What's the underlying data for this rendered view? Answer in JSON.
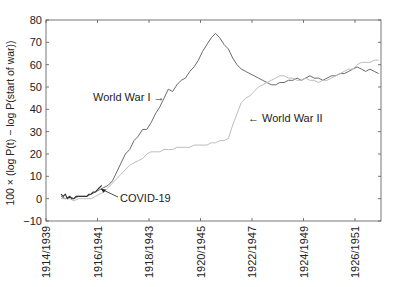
{
  "chart_data": {
    "type": "line",
    "title": "",
    "xlabel": "",
    "ylabel": "100 × (log P(t) − log P(start of war))",
    "ylim": [
      -10,
      80
    ],
    "yticks": [
      -10,
      0,
      10,
      20,
      30,
      40,
      50,
      60,
      70,
      80
    ],
    "xticks": [
      "1914/1939",
      "1916/1941",
      "1918/1943",
      "1920/1945",
      "1922/1947",
      "1924/1949",
      "1926/1951"
    ],
    "x_unit": "months since start of tick 1914/1939",
    "grid": false,
    "legend": "none (inline annotations)",
    "series": [
      {
        "name": "World War I",
        "color": "#6b6b6b",
        "x": [
          7,
          9,
          11,
          13,
          15,
          17,
          19,
          21,
          23,
          25,
          27,
          29,
          31,
          33,
          35,
          37,
          39,
          41,
          43,
          45,
          47,
          49,
          51,
          53,
          55,
          57,
          59,
          61,
          63,
          65,
          67,
          69,
          71,
          73,
          75,
          77,
          79,
          81,
          83,
          85,
          87,
          89,
          91,
          93,
          95,
          97,
          99,
          101,
          103,
          105,
          107,
          109,
          111,
          113,
          115,
          117,
          119,
          121,
          123,
          125,
          127,
          129,
          131,
          133,
          135,
          137,
          139,
          141,
          143,
          145,
          147,
          149,
          151,
          153,
          155
        ],
        "values": [
          1,
          0,
          1,
          0,
          1,
          1,
          1,
          2,
          3,
          4,
          5,
          6,
          8,
          12,
          16,
          20,
          22,
          26,
          28,
          31,
          31,
          34,
          38,
          41,
          45,
          49,
          48,
          51,
          53,
          54,
          57,
          59,
          62,
          66,
          69,
          72,
          74,
          72,
          69,
          67,
          63,
          60,
          58,
          57,
          56,
          55,
          54,
          53,
          52,
          51,
          51,
          52,
          52,
          53,
          53,
          54,
          53,
          54,
          55,
          54,
          54,
          53,
          54,
          55,
          55,
          56,
          56,
          57,
          58,
          59,
          58,
          57,
          58,
          57,
          56
        ]
      },
      {
        "name": "World War II",
        "color": "#bdbdbd",
        "x": [
          7,
          9,
          11,
          13,
          15,
          17,
          19,
          21,
          23,
          25,
          27,
          29,
          31,
          33,
          35,
          37,
          39,
          41,
          43,
          45,
          47,
          49,
          51,
          53,
          55,
          57,
          59,
          61,
          63,
          65,
          67,
          69,
          71,
          73,
          75,
          77,
          79,
          81,
          83,
          85,
          87,
          89,
          91,
          93,
          95,
          97,
          99,
          101,
          103,
          105,
          107,
          109,
          111,
          113,
          115,
          117,
          119,
          121,
          123,
          125,
          127,
          129,
          131,
          133,
          135,
          137,
          139,
          141,
          143,
          145,
          147,
          149,
          151,
          153,
          155
        ],
        "values": [
          0,
          0,
          0,
          -1,
          0,
          0,
          0,
          0,
          1,
          2,
          3,
          5,
          7,
          9,
          11,
          13,
          15,
          16,
          17,
          18,
          20,
          21,
          21,
          21,
          22,
          22,
          22,
          23,
          23,
          23,
          23,
          24,
          24,
          24,
          24,
          25,
          25,
          26,
          26,
          27,
          33,
          38,
          43,
          45,
          46,
          48,
          50,
          51,
          52,
          53,
          54,
          55,
          55,
          54,
          54,
          53,
          53,
          54,
          53,
          53,
          52,
          53,
          53,
          54,
          55,
          56,
          57,
          58,
          58,
          60,
          61,
          61,
          61,
          62,
          62
        ]
      },
      {
        "name": "COVID-19",
        "color": "#333333",
        "x": [
          7,
          8,
          9,
          10,
          11,
          12,
          13,
          14,
          15,
          16,
          17,
          18,
          19,
          20,
          21,
          22,
          23,
          24,
          25,
          26
        ],
        "values": [
          2,
          1,
          2,
          0,
          1,
          0,
          0,
          1,
          1,
          1,
          1,
          1,
          1,
          2,
          2,
          3,
          3,
          4,
          5,
          6
        ]
      }
    ],
    "annotations": [
      {
        "text": "World War I →",
        "target_series": "World War I"
      },
      {
        "text": "← World War II",
        "target_series": "World War II"
      },
      {
        "text": "COVID-19",
        "target_series": "COVID-19",
        "arrow": true
      }
    ]
  }
}
